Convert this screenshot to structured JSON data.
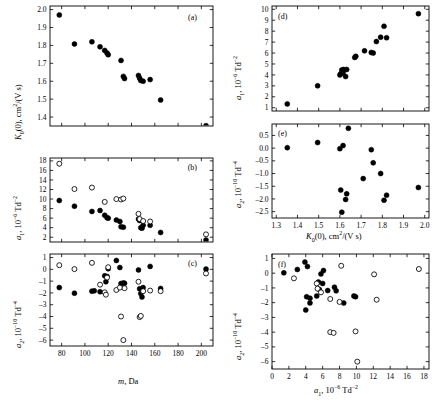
{
  "figure": {
    "panels": [
      "a",
      "b",
      "c",
      "d",
      "e",
      "f"
    ],
    "marker_filled_color": "#000000",
    "marker_open_color": "#ffffff",
    "axis_color": "#000000"
  },
  "labels": {
    "m_da": "m, Da",
    "K0": "K₀(0), cm²/(V s)",
    "a1": "a₁, 10⁻⁶ Td⁻²",
    "a2": "a₂, 10⁻¹⁰ Td⁻⁴",
    "tag_a": "(a)",
    "tag_b": "(b)",
    "tag_c": "(c)",
    "tag_d": "(d)",
    "tag_e": "(e)",
    "tag_f": "(f)"
  },
  "chart_data": [
    {
      "id": "a",
      "type": "scatter",
      "title": "(a)",
      "xlabel": "m, Da",
      "ylabel": "K0(0), cm2/(V s)",
      "xlim": [
        70,
        210
      ],
      "ylim": [
        1.35,
        2.02
      ],
      "xticks": [
        80,
        100,
        120,
        140,
        160,
        180,
        200
      ],
      "yticks": [
        1.4,
        1.5,
        1.6,
        1.7,
        1.8,
        1.9,
        2.0
      ],
      "ytick_labels": [
        "1.4",
        "1.5",
        "1.6",
        "1.7",
        "1.8",
        "1.9",
        "2.0"
      ],
      "grid": false,
      "series": [
        {
          "name": "filled",
          "marker": "filled",
          "points": [
            [
              78,
              1.97
            ],
            [
              91,
              1.808
            ],
            [
              106,
              1.82
            ],
            [
              113,
              1.792
            ],
            [
              117,
              1.772
            ],
            [
              119,
              1.757
            ],
            [
              120,
              1.748
            ],
            [
              131,
              1.716
            ],
            [
              133,
              1.627
            ],
            [
              134,
              1.615
            ],
            [
              146,
              1.632
            ],
            [
              147,
              1.617
            ],
            [
              148,
              1.604
            ],
            [
              150,
              1.6
            ],
            [
              156,
              1.609
            ],
            [
              165,
              1.495
            ],
            [
              204,
              1.352
            ]
          ]
        }
      ]
    },
    {
      "id": "b",
      "type": "scatter",
      "title": "(b)",
      "xlabel": "m, Da",
      "ylabel": "a1, 10-6 Td-2",
      "xlim": [
        70,
        210
      ],
      "ylim": [
        1.0,
        18.6
      ],
      "xticks": [
        80,
        100,
        120,
        140,
        160,
        180,
        200
      ],
      "yticks": [
        2,
        4,
        6,
        8,
        10,
        12,
        14,
        16,
        18
      ],
      "ytick_labels": [
        "2",
        "4",
        "6",
        "8",
        "10",
        "12",
        "14",
        "16",
        "18"
      ],
      "grid": false,
      "series": [
        {
          "name": "filled",
          "marker": "filled",
          "points": [
            [
              78,
              9.7
            ],
            [
              91,
              8.5
            ],
            [
              106,
              7.4
            ],
            [
              113,
              7.6
            ],
            [
              117,
              6.6
            ],
            [
              119,
              6.1
            ],
            [
              120,
              6.0
            ],
            [
              127,
              5.6
            ],
            [
              130,
              5.3
            ],
            [
              131,
              4.2
            ],
            [
              133,
              4.1
            ],
            [
              146,
              5.8
            ],
            [
              147,
              5.5
            ],
            [
              148,
              4.0
            ],
            [
              149,
              3.9
            ],
            [
              150,
              4.5
            ],
            [
              156,
              4.5
            ],
            [
              165,
              3.0
            ],
            [
              204,
              1.4
            ]
          ]
        },
        {
          "name": "open",
          "marker": "open",
          "points": [
            [
              78,
              17.4
            ],
            [
              91,
              12.1
            ],
            [
              106,
              12.4
            ],
            [
              117,
              9.4
            ],
            [
              127,
              10.0
            ],
            [
              131,
              9.9
            ],
            [
              133,
              10.1
            ],
            [
              146,
              6.9
            ],
            [
              147,
              5.8
            ],
            [
              150,
              5.4
            ],
            [
              156,
              5.3
            ],
            [
              204,
              2.6
            ]
          ]
        }
      ]
    },
    {
      "id": "c",
      "type": "scatter",
      "title": "(c)",
      "xlabel": "m, Da",
      "ylabel": "a2, 10-10 Td-4",
      "xlim": [
        70,
        210
      ],
      "ylim": [
        -6.5,
        1.3
      ],
      "xticks": [
        80,
        100,
        120,
        140,
        160,
        180,
        200
      ],
      "yticks": [
        1,
        0,
        -1,
        -2,
        -3,
        -4,
        -5,
        -6
      ],
      "ytick_labels": [
        "1",
        "0",
        "–1",
        "–2",
        "–3",
        "–4",
        "–5",
        "–6"
      ],
      "grid": false,
      "series": [
        {
          "name": "filled",
          "marker": "filled",
          "points": [
            [
              78,
              -1.55
            ],
            [
              91,
              -2.02
            ],
            [
              106,
              -1.85
            ],
            [
              108,
              -1.82
            ],
            [
              113,
              -1.9
            ],
            [
              117,
              -0.55
            ],
            [
              118,
              -1.05
            ],
            [
              119,
              -0.6
            ],
            [
              120,
              0.05
            ],
            [
              127,
              0.75
            ],
            [
              130,
              0.15
            ],
            [
              131,
              -1.2
            ],
            [
              133,
              -1.15
            ],
            [
              134,
              -1.18
            ],
            [
              146,
              -0.05
            ],
            [
              147,
              -1.65
            ],
            [
              148,
              -2.05
            ],
            [
              149,
              -2.35
            ],
            [
              150,
              -1.55
            ],
            [
              156,
              0.25
            ],
            [
              165,
              -1.62
            ],
            [
              204,
              0.02
            ]
          ]
        },
        {
          "name": "open",
          "marker": "open",
          "points": [
            [
              78,
              0.35
            ],
            [
              91,
              0.02
            ],
            [
              106,
              0.55
            ],
            [
              113,
              -1.3
            ],
            [
              117,
              -1.95
            ],
            [
              118,
              -2.15
            ],
            [
              119,
              -0.7
            ],
            [
              120,
              0.18
            ],
            [
              127,
              -1.75
            ],
            [
              130,
              -1.55
            ],
            [
              131,
              -4.0
            ],
            [
              133,
              -6.0
            ],
            [
              134,
              -1.6
            ],
            [
              146,
              -1.05
            ],
            [
              147,
              -4.05
            ],
            [
              148,
              -3.95
            ],
            [
              150,
              -1.85
            ],
            [
              156,
              -1.8
            ],
            [
              165,
              -1.85
            ],
            [
              204,
              -0.35
            ]
          ]
        }
      ]
    },
    {
      "id": "d",
      "type": "scatter",
      "title": "(d)",
      "xlabel": "K0(0), cm2/(V s)",
      "ylabel": "a1, 10-6 Td-2",
      "xlim": [
        1.28,
        2.02
      ],
      "ylim": [
        0.7,
        10.3
      ],
      "xticks": [
        1.3,
        1.4,
        1.5,
        1.6,
        1.7,
        1.8,
        1.9,
        2.0
      ],
      "yticks": [
        1,
        2,
        3,
        4,
        5,
        6,
        7,
        8,
        9,
        10
      ],
      "ytick_labels": [
        "1",
        "2",
        "3",
        "4",
        "5",
        "6",
        "7",
        "8",
        "9",
        "10"
      ],
      "grid": false,
      "series": [
        {
          "name": "filled",
          "marker": "filled",
          "points": [
            [
              1.352,
              1.35
            ],
            [
              1.495,
              3.0
            ],
            [
              1.6,
              4.0
            ],
            [
              1.604,
              4.1
            ],
            [
              1.609,
              4.45
            ],
            [
              1.615,
              4.2
            ],
            [
              1.617,
              4.5
            ],
            [
              1.627,
              3.85
            ],
            [
              1.632,
              4.5
            ],
            [
              1.67,
              5.6
            ],
            [
              1.675,
              5.7
            ],
            [
              1.716,
              6.2
            ],
            [
              1.748,
              6.05
            ],
            [
              1.757,
              6.0
            ],
            [
              1.772,
              7.05
            ],
            [
              1.792,
              7.45
            ],
            [
              1.808,
              8.45
            ],
            [
              1.82,
              7.4
            ],
            [
              1.97,
              9.6
            ]
          ]
        }
      ]
    },
    {
      "id": "e",
      "type": "scatter",
      "title": "(e)",
      "xlabel": "K0(0), cm2/(V s)",
      "ylabel": "a2, 10-10 Td-4",
      "xlim": [
        1.28,
        2.02
      ],
      "ylim": [
        -2.75,
        0.95
      ],
      "xticks": [
        1.3,
        1.4,
        1.5,
        1.6,
        1.7,
        1.8,
        1.9,
        2.0
      ],
      "xtick_labels": [
        "1.3",
        "1.4",
        "1.5",
        "1.6",
        "1.7",
        "1.8",
        "1.9",
        "2.0"
      ],
      "yticks": [
        0.5,
        0.0,
        -0.5,
        -1.0,
        -1.5,
        -2.0,
        -2.5
      ],
      "ytick_labels": [
        "0.5",
        "0.0",
        "–0.5",
        "–1.0",
        "–1.5",
        "–2.0",
        "–2.5"
      ],
      "grid": false,
      "series": [
        {
          "name": "filled",
          "marker": "filled",
          "points": [
            [
              1.352,
              0.02
            ],
            [
              1.495,
              0.22
            ],
            [
              1.6,
              -0.02
            ],
            [
              1.604,
              -1.65
            ],
            [
              1.609,
              -2.52
            ],
            [
              1.615,
              0.1
            ],
            [
              1.627,
              -2.02
            ],
            [
              1.632,
              -1.8
            ],
            [
              1.64,
              0.78
            ],
            [
              1.71,
              -1.2
            ],
            [
              1.748,
              -0.06
            ],
            [
              1.757,
              -0.58
            ],
            [
              1.792,
              -1.0
            ],
            [
              1.808,
              -2.05
            ],
            [
              1.82,
              -1.85
            ],
            [
              1.97,
              -1.55
            ]
          ]
        }
      ]
    },
    {
      "id": "f",
      "type": "scatter",
      "title": "(f)",
      "xlabel": "a1, 10-6 Td-2",
      "ylabel": "a2, 10-10 Td-4",
      "xlim": [
        0,
        18.6
      ],
      "ylim": [
        -6.5,
        1.3
      ],
      "xticks": [
        0,
        2,
        4,
        6,
        8,
        10,
        12,
        14,
        16,
        18
      ],
      "yticks": [
        1,
        0,
        -1,
        -2,
        -3,
        -4,
        -5,
        -6
      ],
      "ytick_labels": [
        "1",
        "0",
        "–1",
        "–2",
        "–3",
        "–4",
        "–5",
        "–6"
      ],
      "grid": false,
      "series": [
        {
          "name": "filled",
          "marker": "filled",
          "points": [
            [
              1.4,
              0.02
            ],
            [
              3.0,
              0.25
            ],
            [
              3.9,
              0.75
            ],
            [
              4.0,
              -2.5
            ],
            [
              4.1,
              -1.6
            ],
            [
              4.2,
              0.45
            ],
            [
              4.5,
              -1.7
            ],
            [
              4.5,
              -2.02
            ],
            [
              5.3,
              -1.55
            ],
            [
              5.5,
              -0.6
            ],
            [
              5.6,
              -1.1
            ],
            [
              5.8,
              -0.05
            ],
            [
              6.0,
              -0.7
            ],
            [
              6.1,
              0.18
            ],
            [
              6.6,
              -1.18
            ],
            [
              7.4,
              -0.95
            ],
            [
              7.6,
              -1.2
            ],
            [
              8.5,
              -2.02
            ],
            [
              9.7,
              -1.55
            ],
            [
              9.9,
              -1.6
            ]
          ]
        },
        {
          "name": "open",
          "marker": "open",
          "points": [
            [
              2.6,
              -0.35
            ],
            [
              5.3,
              -0.7
            ],
            [
              5.4,
              -1.05
            ],
            [
              5.8,
              -1.3
            ],
            [
              6.9,
              -1.75
            ],
            [
              6.9,
              -4.0
            ],
            [
              7.3,
              -4.05
            ],
            [
              8.0,
              -1.95
            ],
            [
              8.2,
              0.5
            ],
            [
              9.9,
              -3.95
            ],
            [
              10.1,
              -6.0
            ],
            [
              12.1,
              -0.08
            ],
            [
              12.4,
              -1.8
            ],
            [
              17.4,
              0.28
            ]
          ]
        }
      ]
    }
  ]
}
